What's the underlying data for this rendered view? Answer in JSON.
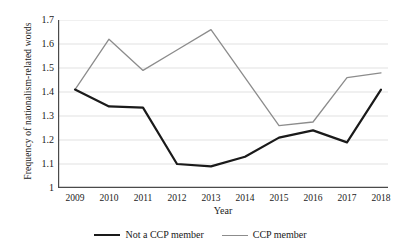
{
  "chart_data": {
    "type": "line",
    "title": "",
    "xlabel": "Year",
    "ylabel": "Frequency of nationalism-related words",
    "categories": [
      "2009",
      "2010",
      "2011",
      "2012",
      "2013",
      "2014",
      "2015",
      "2016",
      "2017",
      "2018"
    ],
    "x": [
      2009,
      2010,
      2011,
      2012,
      2013,
      2014,
      2015,
      2016,
      2017,
      2018
    ],
    "xlim": [
      2009,
      2018
    ],
    "ylim": [
      1.0,
      1.7
    ],
    "yticks": [
      "1",
      "1.1",
      "1.2",
      "1.3",
      "1.4",
      "1.5",
      "1.6",
      "1.7"
    ],
    "ytick_values": [
      1.0,
      1.1,
      1.2,
      1.3,
      1.4,
      1.5,
      1.6,
      1.7
    ],
    "grid": "horizontal",
    "legend_position": "bottom",
    "series": [
      {
        "name": "Not a CCP member",
        "color": "#1a1a1a",
        "width": 2.2,
        "values": [
          1.41,
          1.34,
          1.335,
          1.1,
          1.09,
          1.13,
          1.21,
          1.24,
          1.19,
          1.41
        ]
      },
      {
        "name": "CCP member",
        "color": "#8c8c8c",
        "width": 1.3,
        "values": [
          1.41,
          1.62,
          1.49,
          1.575,
          1.66,
          1.46,
          1.26,
          1.275,
          1.46,
          1.48
        ]
      }
    ]
  },
  "axis": {
    "line_color": "#4a4a4a",
    "grid_color": "#d9d9d9"
  }
}
